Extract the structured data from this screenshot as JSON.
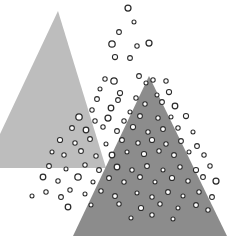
{
  "figure": {
    "width": 232,
    "height": 251,
    "background": "#ffffff",
    "title": "",
    "caption": ""
  },
  "colors": {
    "background": "#ffffff",
    "triangle_light": "#bdbdbd",
    "triangle_dark": "#8c8c8c",
    "point_stroke": "#2b2b2b",
    "point_fill": "#ffffff"
  },
  "chart_data": {
    "type": "scatter",
    "title": "",
    "subtitle": "",
    "xlabel": "",
    "ylabel": "",
    "xlim": [
      0,
      232
    ],
    "ylim": [
      0,
      251
    ],
    "grid": false,
    "legend": "none",
    "annotations": [],
    "shapes": [
      {
        "name": "triangle-light",
        "type": "triangle",
        "fill": "#bdbdbd",
        "opacity": 1,
        "points": [
          [
            58,
            11
          ],
          [
            -16,
            168
          ],
          [
            106,
            168
          ]
        ],
        "points_label": "apex (58,11); base from (-16,168) to (106,168)"
      },
      {
        "name": "triangle-dark",
        "type": "triangle",
        "fill": "#8c8c8c",
        "opacity": 1,
        "points": [
          [
            149,
            76
          ],
          [
            73,
            236
          ],
          [
            227,
            236
          ]
        ],
        "points_label": "apex (149,76); base from (73,236) to (227,236)"
      }
    ],
    "series": [
      {
        "name": "points",
        "marker": "open-circle",
        "marker_stroke": "#2b2b2b",
        "marker_fill": "#ffffff",
        "count": 96,
        "points": [
          [
            128,
            8,
            3.0
          ],
          [
            134,
            22,
            2.0
          ],
          [
            119,
            32,
            2.4
          ],
          [
            112,
            44,
            3.2
          ],
          [
            137,
            46,
            2.2
          ],
          [
            149,
            43,
            3.0
          ],
          [
            115,
            57,
            2.6
          ],
          [
            130,
            58,
            2.4
          ],
          [
            105,
            79,
            2.2
          ],
          [
            114,
            81,
            3.2
          ],
          [
            139,
            76,
            2.4
          ],
          [
            153,
            80,
            2.2
          ],
          [
            100,
            89,
            2.0
          ],
          [
            120,
            93,
            2.6
          ],
          [
            146,
            83,
            2.0
          ],
          [
            166,
            81,
            2.2
          ],
          [
            97,
            99,
            2.4
          ],
          [
            118,
            100,
            2.4
          ],
          [
            136,
            98,
            2.2
          ],
          [
            157,
            95,
            2.0
          ],
          [
            169,
            92,
            2.6
          ],
          [
            92,
            110,
            2.2
          ],
          [
            111,
            108,
            2.8
          ],
          [
            130,
            112,
            2.0
          ],
          [
            145,
            104,
            2.2
          ],
          [
            162,
            102,
            2.4
          ],
          [
            175,
            106,
            2.8
          ],
          [
            79,
            117,
            3.2
          ],
          [
            95,
            121,
            2.2
          ],
          [
            108,
            118,
            3.0
          ],
          [
            124,
            121,
            2.2
          ],
          [
            140,
            116,
            2.4
          ],
          [
            158,
            118,
            2.2
          ],
          [
            171,
            117,
            2.0
          ],
          [
            186,
            116,
            2.6
          ],
          [
            72,
            128,
            2.4
          ],
          [
            86,
            130,
            2.8
          ],
          [
            103,
            127,
            2.2
          ],
          [
            117,
            131,
            2.4
          ],
          [
            133,
            127,
            2.6
          ],
          [
            148,
            132,
            2.2
          ],
          [
            163,
            129,
            2.4
          ],
          [
            178,
            128,
            2.2
          ],
          [
            193,
            132,
            2.0
          ],
          [
            60,
            140,
            2.6
          ],
          [
            75,
            143,
            2.2
          ],
          [
            90,
            139,
            2.4
          ],
          [
            106,
            144,
            2.0
          ],
          [
            112,
            155,
            2.8
          ],
          [
            122,
            140,
            2.4
          ],
          [
            138,
            143,
            2.2
          ],
          [
            152,
            140,
            2.6
          ],
          [
            166,
            144,
            2.2
          ],
          [
            181,
            141,
            2.4
          ],
          [
            197,
            146,
            2.4
          ],
          [
            52,
            152,
            2.0
          ],
          [
            64,
            155,
            2.2
          ],
          [
            81,
            151,
            2.4
          ],
          [
            96,
            156,
            2.2
          ],
          [
            127,
            152,
            2.0
          ],
          [
            144,
            154,
            2.6
          ],
          [
            159,
            151,
            2.2
          ],
          [
            174,
            155,
            2.4
          ],
          [
            189,
            152,
            2.0
          ],
          [
            204,
            155,
            2.2
          ],
          [
            49,
            166,
            2.4
          ],
          [
            66,
            169,
            2.0
          ],
          [
            85,
            165,
            2.2
          ],
          [
            99,
            170,
            2.4
          ],
          [
            117,
            167,
            2.8
          ],
          [
            132,
            170,
            2.2
          ],
          [
            147,
            166,
            2.4
          ],
          [
            163,
            170,
            2.0
          ],
          [
            180,
            167,
            2.2
          ],
          [
            196,
            170,
            2.6
          ],
          [
            210,
            166,
            2.2
          ],
          [
            43,
            177,
            2.8
          ],
          [
            58,
            181,
            2.2
          ],
          [
            78,
            177,
            3.2
          ],
          [
            93,
            182,
            2.0
          ],
          [
            109,
            178,
            2.4
          ],
          [
            124,
            182,
            2.2
          ],
          [
            140,
            177,
            2.4
          ],
          [
            155,
            182,
            2.0
          ],
          [
            172,
            178,
            2.6
          ],
          [
            188,
            181,
            2.2
          ],
          [
            203,
            177,
            2.4
          ],
          [
            216,
            181,
            3.0
          ],
          [
            32,
            196,
            2.0
          ],
          [
            46,
            192,
            2.2
          ],
          [
            61,
            197,
            2.4
          ],
          [
            70,
            190,
            2.2
          ],
          [
            85,
            194,
            2.0
          ],
          [
            101,
            191,
            2.2
          ],
          [
            115,
            196,
            2.4
          ],
          [
            137,
            193,
            2.0
          ],
          [
            152,
            197,
            2.2
          ],
          [
            168,
            192,
            2.4
          ],
          [
            183,
            196,
            2.0
          ],
          [
            199,
            192,
            2.2
          ],
          [
            212,
            197,
            2.4
          ],
          [
            68,
            207,
            2.8
          ],
          [
            91,
            205,
            2.0
          ],
          [
            119,
            204,
            2.2
          ],
          [
            141,
            208,
            2.6
          ],
          [
            160,
            204,
            2.2
          ],
          [
            178,
            208,
            2.0
          ],
          [
            196,
            205,
            2.4
          ],
          [
            208,
            210,
            2.2
          ],
          [
            131,
            218,
            2.0
          ],
          [
            152,
            215,
            2.2
          ],
          [
            173,
            219,
            2.0
          ]
        ]
      }
    ]
  }
}
